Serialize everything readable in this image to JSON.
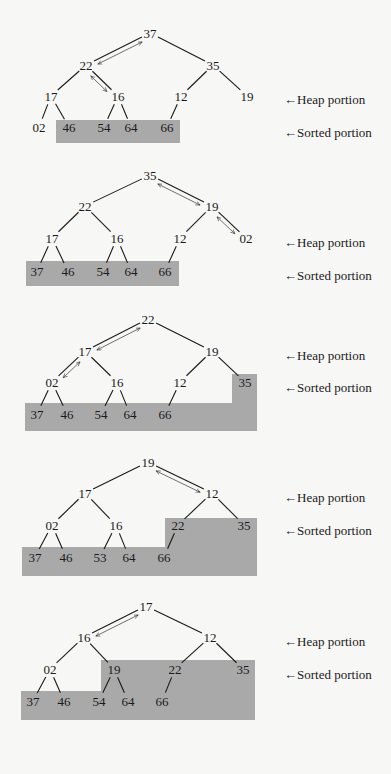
{
  "labels": {
    "heap": "←Heap portion",
    "sorted": "←Sorted portion"
  },
  "colors": {
    "background": "#f7f7f5",
    "sorted_fill": "#a9a9a9",
    "ink": "#1a1a1a"
  },
  "diagrams": [
    {
      "step": 1,
      "nodes": [
        {
          "v": "37",
          "x": 150,
          "y": 37
        },
        {
          "v": "22",
          "x": 86,
          "y": 69
        },
        {
          "v": "35",
          "x": 213,
          "y": 69
        },
        {
          "v": "17",
          "x": 51,
          "y": 100
        },
        {
          "v": "16",
          "x": 118,
          "y": 100
        },
        {
          "v": "12",
          "x": 181,
          "y": 100
        },
        {
          "v": "19",
          "x": 247,
          "y": 100
        },
        {
          "v": "02",
          "x": 39,
          "y": 131
        },
        {
          "v": "46",
          "x": 69,
          "y": 131
        },
        {
          "v": "54",
          "x": 104,
          "y": 131
        },
        {
          "v": "64",
          "x": 131,
          "y": 131
        },
        {
          "v": "66",
          "x": 167,
          "y": 131
        }
      ],
      "edges": [
        [
          0,
          1
        ],
        [
          0,
          2
        ],
        [
          1,
          3
        ],
        [
          1,
          4
        ],
        [
          2,
          5
        ],
        [
          2,
          6
        ],
        [
          3,
          7
        ],
        [
          3,
          8
        ],
        [
          4,
          9
        ],
        [
          4,
          10
        ],
        [
          5,
          11
        ]
      ],
      "swaps": [
        [
          0,
          1
        ],
        [
          1,
          4
        ]
      ],
      "sorted_polygon": "56,120 180,120 180,143 56,143",
      "heap_label_y": 100,
      "sorted_label_y": 133
    },
    {
      "step": 2,
      "nodes": [
        {
          "v": "35",
          "x": 150,
          "y": 179
        },
        {
          "v": "22",
          "x": 85,
          "y": 210
        },
        {
          "v": "19",
          "x": 212,
          "y": 210
        },
        {
          "v": "17",
          "x": 52,
          "y": 242
        },
        {
          "v": "16",
          "x": 117,
          "y": 242
        },
        {
          "v": "12",
          "x": 180,
          "y": 242
        },
        {
          "v": "02",
          "x": 246,
          "y": 242
        },
        {
          "v": "37",
          "x": 37,
          "y": 275
        },
        {
          "v": "46",
          "x": 68,
          "y": 275
        },
        {
          "v": "54",
          "x": 103,
          "y": 275
        },
        {
          "v": "64",
          "x": 131,
          "y": 275
        },
        {
          "v": "66",
          "x": 165,
          "y": 275
        }
      ],
      "edges": [
        [
          0,
          1
        ],
        [
          0,
          2
        ],
        [
          1,
          3
        ],
        [
          1,
          4
        ],
        [
          2,
          5
        ],
        [
          2,
          6
        ],
        [
          3,
          7
        ],
        [
          3,
          8
        ],
        [
          4,
          9
        ],
        [
          4,
          10
        ],
        [
          5,
          11
        ]
      ],
      "swaps": [
        [
          0,
          2
        ],
        [
          2,
          6
        ]
      ],
      "sorted_polygon": "26,261 179,261 179,286 26,286",
      "heap_label_y": 243,
      "sorted_label_y": 276
    },
    {
      "step": 3,
      "nodes": [
        {
          "v": "22",
          "x": 148,
          "y": 323
        },
        {
          "v": "17",
          "x": 85,
          "y": 355
        },
        {
          "v": "19",
          "x": 212,
          "y": 355
        },
        {
          "v": "02",
          "x": 52,
          "y": 386
        },
        {
          "v": "16",
          "x": 117,
          "y": 386
        },
        {
          "v": "12",
          "x": 180,
          "y": 386
        },
        {
          "v": "35",
          "x": 245,
          "y": 386
        },
        {
          "v": "37",
          "x": 37,
          "y": 418
        },
        {
          "v": "46",
          "x": 67,
          "y": 418
        },
        {
          "v": "54",
          "x": 101,
          "y": 418
        },
        {
          "v": "64",
          "x": 130,
          "y": 418
        },
        {
          "v": "66",
          "x": 165,
          "y": 418
        }
      ],
      "edges": [
        [
          0,
          1
        ],
        [
          0,
          2
        ],
        [
          1,
          3
        ],
        [
          1,
          4
        ],
        [
          2,
          5
        ],
        [
          2,
          6
        ],
        [
          3,
          7
        ],
        [
          3,
          8
        ],
        [
          4,
          9
        ],
        [
          4,
          10
        ],
        [
          5,
          11
        ]
      ],
      "swaps": [
        [
          0,
          1
        ],
        [
          1,
          3
        ]
      ],
      "sorted_polygon": "25,403 232,403 232,374 257,374 257,431 25,431",
      "heap_label_y": 356,
      "sorted_label_y": 388
    },
    {
      "step": 4,
      "nodes": [
        {
          "v": "19",
          "x": 148,
          "y": 466
        },
        {
          "v": "17",
          "x": 85,
          "y": 497
        },
        {
          "v": "12",
          "x": 212,
          "y": 497
        },
        {
          "v": "02",
          "x": 52,
          "y": 529
        },
        {
          "v": "16",
          "x": 116,
          "y": 529
        },
        {
          "v": "22",
          "x": 178,
          "y": 529
        },
        {
          "v": "35",
          "x": 244,
          "y": 529
        },
        {
          "v": "37",
          "x": 35,
          "y": 561
        },
        {
          "v": "46",
          "x": 66,
          "y": 561
        },
        {
          "v": "53",
          "x": 100,
          "y": 561
        },
        {
          "v": "64",
          "x": 129,
          "y": 561
        },
        {
          "v": "66",
          "x": 164,
          "y": 561
        }
      ],
      "edges": [
        [
          0,
          1
        ],
        [
          0,
          2
        ],
        [
          1,
          3
        ],
        [
          1,
          4
        ],
        [
          2,
          5
        ],
        [
          2,
          6
        ],
        [
          3,
          7
        ],
        [
          3,
          8
        ],
        [
          4,
          9
        ],
        [
          4,
          10
        ],
        [
          5,
          11
        ]
      ],
      "swaps": [
        [
          0,
          2
        ]
      ],
      "sorted_polygon": "22,547 165,547 165,518 257,518 257,576 22,576",
      "heap_label_y": 498,
      "sorted_label_y": 531
    },
    {
      "step": 5,
      "nodes": [
        {
          "v": "17",
          "x": 146,
          "y": 610
        },
        {
          "v": "16",
          "x": 84,
          "y": 641
        },
        {
          "v": "12",
          "x": 210,
          "y": 641
        },
        {
          "v": "02",
          "x": 50,
          "y": 673
        },
        {
          "v": "19",
          "x": 114,
          "y": 673
        },
        {
          "v": "22",
          "x": 175,
          "y": 673
        },
        {
          "v": "35",
          "x": 243,
          "y": 673
        },
        {
          "v": "37",
          "x": 33,
          "y": 705
        },
        {
          "v": "46",
          "x": 64,
          "y": 705
        },
        {
          "v": "54",
          "x": 99,
          "y": 705
        },
        {
          "v": "64",
          "x": 128,
          "y": 705
        },
        {
          "v": "66",
          "x": 162,
          "y": 705
        }
      ],
      "edges": [
        [
          0,
          1
        ],
        [
          0,
          2
        ],
        [
          1,
          3
        ],
        [
          1,
          4
        ],
        [
          2,
          5
        ],
        [
          2,
          6
        ],
        [
          3,
          7
        ],
        [
          3,
          8
        ],
        [
          4,
          9
        ],
        [
          4,
          10
        ],
        [
          5,
          11
        ]
      ],
      "swaps": [
        [
          0,
          1
        ]
      ],
      "sorted_polygon": "21,691 101,691 101,660 255,660 255,720 21,720",
      "heap_label_y": 642,
      "sorted_label_y": 675
    }
  ]
}
